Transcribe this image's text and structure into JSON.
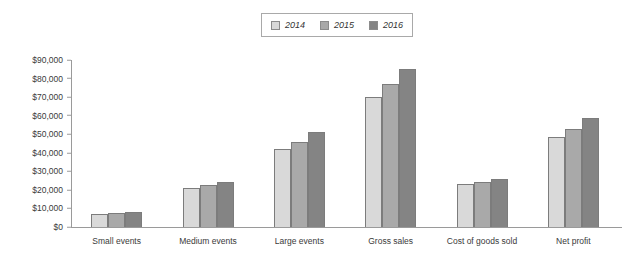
{
  "chart_data": {
    "type": "bar",
    "title": "",
    "subtitle": "",
    "xlabel": "",
    "ylabel": "",
    "grid": false,
    "legend_position": "top-center",
    "ylim": [
      0,
      90000
    ],
    "ytick_labels": [
      "$90,000",
      "$80,000",
      "$70,000",
      "$60,000",
      "$50,000",
      "$40,000",
      "$30,000",
      "$20,000",
      "$10,000",
      "$0"
    ],
    "ytick_values": [
      90000,
      80000,
      70000,
      60000,
      50000,
      40000,
      30000,
      20000,
      10000,
      0
    ],
    "categories": [
      "Small events",
      "Medium events",
      "Large events",
      "Gross sales",
      "Cost of goods sold",
      "Net profit"
    ],
    "series": [
      {
        "name": "2014",
        "color": "#d9d9d9",
        "values": [
          7000,
          21000,
          42000,
          70000,
          23000,
          48500
        ]
      },
      {
        "name": "2015",
        "color": "#a9a9a9",
        "values": [
          7500,
          22500,
          46000,
          77000,
          24500,
          53000
        ]
      },
      {
        "name": "2016",
        "color": "#848484",
        "values": [
          8000,
          24000,
          51000,
          85000,
          26000,
          58500
        ]
      }
    ]
  },
  "legend": {
    "items": [
      {
        "label": "2014",
        "color": "#d9d9d9"
      },
      {
        "label": "2015",
        "color": "#a9a9a9"
      },
      {
        "label": "2016",
        "color": "#848484"
      }
    ]
  },
  "colors": {
    "series_2014": "#d9d9d9",
    "series_2015": "#a9a9a9",
    "series_2016": "#848484",
    "axis": "#9a9a9a",
    "bar_outline": "#7c7c7c",
    "text": "#3a3a3a",
    "background": "#ffffff"
  }
}
